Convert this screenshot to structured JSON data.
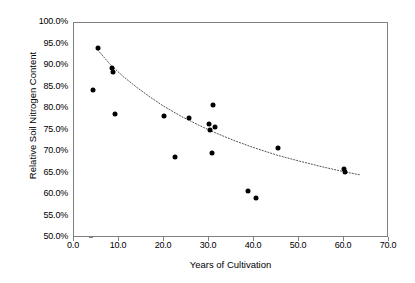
{
  "chart_data": {
    "type": "scatter",
    "title": "",
    "xlabel": "Years of Cultivation",
    "ylabel": "Relative Soil Nitrogen Content",
    "xlim": [
      0.0,
      70.0
    ],
    "ylim": [
      50.0,
      100.0
    ],
    "grid": false,
    "legend": null,
    "x_tick_labels": [
      "0.0",
      "10.0",
      "20.0",
      "30.0",
      "40.0",
      "50.0",
      "60.0",
      "70.0"
    ],
    "x_tick_values": [
      0,
      10,
      20,
      30,
      40,
      50,
      60,
      70
    ],
    "y_tick_labels": [
      "50.0%",
      "55.0%",
      "60.0%",
      "65.0%",
      "70.0%",
      "75.0%",
      "80.0%",
      "85.0%",
      "90.0%",
      "95.0%",
      "100.0%"
    ],
    "y_tick_values": [
      50,
      55,
      60,
      65,
      70,
      75,
      80,
      85,
      90,
      95,
      100
    ],
    "marker": "filled-circle",
    "marker_color": "#000000",
    "points": [
      {
        "x": 4.2,
        "y": 84.5
      },
      {
        "x": 5.3,
        "y": 94.2
      },
      {
        "x": 8.4,
        "y": 89.6
      },
      {
        "x": 8.6,
        "y": 88.6
      },
      {
        "x": 9.0,
        "y": 78.8
      },
      {
        "x": 20.0,
        "y": 78.3
      },
      {
        "x": 22.4,
        "y": 68.8
      },
      {
        "x": 25.6,
        "y": 78.0
      },
      {
        "x": 30.0,
        "y": 76.6
      },
      {
        "x": 30.3,
        "y": 75.2
      },
      {
        "x": 30.8,
        "y": 80.9
      },
      {
        "x": 31.4,
        "y": 75.9
      },
      {
        "x": 30.6,
        "y": 69.7
      },
      {
        "x": 38.6,
        "y": 61.0
      },
      {
        "x": 40.5,
        "y": 59.2
      },
      {
        "x": 45.4,
        "y": 70.9
      },
      {
        "x": 59.9,
        "y": 66.1
      },
      {
        "x": 60.2,
        "y": 65.4
      }
    ],
    "trendline": {
      "style": "dotted",
      "color": "#555555",
      "points": [
        {
          "x": 5.3,
          "y": 93.7
        },
        {
          "x": 8.0,
          "y": 90.4
        },
        {
          "x": 11.0,
          "y": 87.5
        },
        {
          "x": 14.0,
          "y": 85.0
        },
        {
          "x": 17.0,
          "y": 82.7
        },
        {
          "x": 20.0,
          "y": 80.6
        },
        {
          "x": 24.0,
          "y": 78.2
        },
        {
          "x": 28.0,
          "y": 76.1
        },
        {
          "x": 32.0,
          "y": 74.2
        },
        {
          "x": 36.0,
          "y": 72.5
        },
        {
          "x": 40.0,
          "y": 71.0
        },
        {
          "x": 45.0,
          "y": 69.3
        },
        {
          "x": 50.0,
          "y": 67.9
        },
        {
          "x": 55.0,
          "y": 66.6
        },
        {
          "x": 60.0,
          "y": 65.4
        },
        {
          "x": 63.5,
          "y": 64.7
        }
      ]
    }
  }
}
